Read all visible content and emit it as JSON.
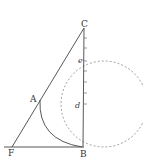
{
  "diagram": {
    "labels": {
      "C": "C",
      "e": "e",
      "A": "A",
      "d": "d",
      "F": "F",
      "B": "B"
    },
    "colors": {
      "stroke": "#444444",
      "background": "#ffffff"
    }
  }
}
